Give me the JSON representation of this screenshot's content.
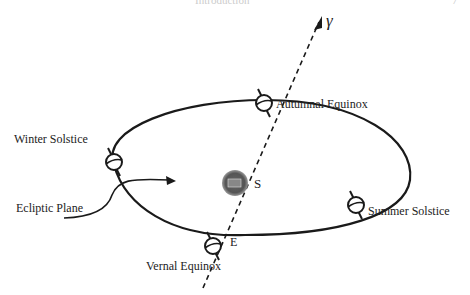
{
  "header": {
    "running_title": "Introduction",
    "page_number": "7"
  },
  "diagram": {
    "axis_label": "γ",
    "sun_label": "S",
    "sun_inner_label": "Sun",
    "earth_label": "E",
    "ecliptic_label": "Ecliptic Plane",
    "positions": [
      {
        "label": "Autumnal Equinox"
      },
      {
        "label": "Winter Solstice"
      },
      {
        "label": "Summer Solstice"
      },
      {
        "label": "Vernal Equinox"
      }
    ],
    "colors": {
      "line": "#1a1a1a",
      "sun": "#555555"
    }
  }
}
